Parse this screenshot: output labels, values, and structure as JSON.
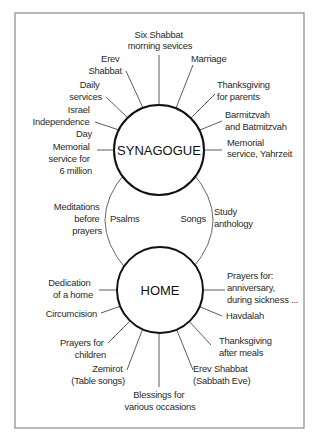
{
  "diagram": {
    "hubs": {
      "synagogue": "SYNAGOGUE",
      "home": "HOME"
    },
    "synagogue_items": [
      [
        "Six Shabbat",
        "morning sevices"
      ],
      [
        "Marriage"
      ],
      [
        "Thanksgiving",
        "for parents"
      ],
      [
        "Barmitzvah",
        "and Batmitzvah"
      ],
      [
        "Memorial",
        "service, Yahrzeit"
      ],
      [
        "Erev",
        "Shabbat"
      ],
      [
        "Daily",
        "services"
      ],
      [
        "Israel",
        "Independence",
        "Day"
      ],
      [
        "Memorial",
        "service for",
        "6 million"
      ]
    ],
    "shared_items": {
      "left_outer": [
        "Meditations",
        "before",
        "prayers"
      ],
      "left_inner": [
        "Psalms"
      ],
      "right_inner": [
        "Songs"
      ],
      "right_outer": [
        "Study",
        "anthology"
      ]
    },
    "home_items": [
      [
        "Dedication",
        "of a home"
      ],
      [
        "Circumcision"
      ],
      [
        "Prayers for",
        "children"
      ],
      [
        "Zemirot",
        "(Table songs)"
      ],
      [
        "Blessings for",
        "various occasions"
      ],
      [
        "Erev Shabbat",
        "(Sabbath Eve)"
      ],
      [
        "Thanksgiving",
        "after meals"
      ],
      [
        "Havdalah"
      ],
      [
        "Prayers for:",
        "anniversary,",
        "during sickness ..."
      ]
    ]
  }
}
